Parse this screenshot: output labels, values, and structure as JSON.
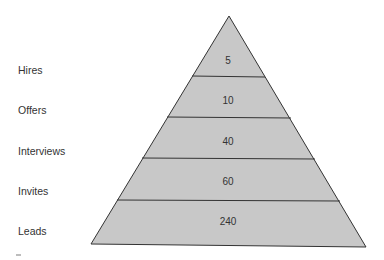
{
  "diagram": {
    "type": "pyramid",
    "fill_color": "#c8c8c8",
    "stroke_color": "#333333",
    "levels": [
      {
        "label": "Hires",
        "value": "5"
      },
      {
        "label": "Offers",
        "value": "10"
      },
      {
        "label": "Interviews",
        "value": "40"
      },
      {
        "label": "Invites",
        "value": "60"
      },
      {
        "label": "Leads",
        "value": "240"
      }
    ]
  }
}
